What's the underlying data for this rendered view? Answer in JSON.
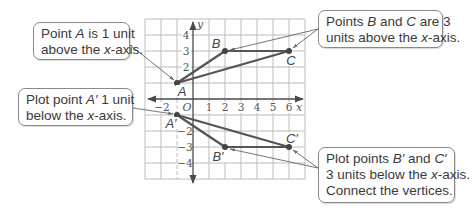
{
  "graph": {
    "x_axis_label": "x",
    "y_axis_label": "y",
    "origin_label": "O",
    "x_ticks": [
      "−2",
      "1",
      "2",
      "3",
      "4",
      "5",
      "6"
    ],
    "y_ticks": [
      "4",
      "3",
      "2",
      "−2",
      "−3",
      "−4"
    ],
    "grid_range": {
      "x": [
        -3,
        7
      ],
      "y": [
        -5,
        5
      ]
    },
    "colors": {
      "grid": "#bdbdbd",
      "axis": "#4a4a4a",
      "polygon": "#555555",
      "arrow": "#666666"
    }
  },
  "points": {
    "A": {
      "label": "A",
      "x": -1,
      "y": 1
    },
    "B": {
      "label": "B",
      "x": 2,
      "y": 3
    },
    "C": {
      "label": "C",
      "x": 6,
      "y": 3
    },
    "A_prime": {
      "label": "A′",
      "x": -1,
      "y": -1
    },
    "B_prime": {
      "label": "B′",
      "x": 2,
      "y": -3
    },
    "C_prime": {
      "label": "C′",
      "x": 6,
      "y": -3
    }
  },
  "callouts": {
    "point_a": {
      "line1_pre": "Point ",
      "line1_var": "A",
      "line1_post": " is 1 unit",
      "line2_pre": "above the ",
      "line2_var": "x",
      "line2_post": "-axis."
    },
    "points_bc": {
      "line1_pre": "Points ",
      "line1_var1": "B",
      "line1_mid": " and ",
      "line1_var2": "C",
      "line1_post": " are 3",
      "line2_pre": "units above the ",
      "line2_var": "x",
      "line2_post": "-axis."
    },
    "plot_a_prime": {
      "line1_pre": "Plot point ",
      "line1_var": "A′",
      "line1_post": " 1 unit",
      "line2_pre": "below the ",
      "line2_var": "x",
      "line2_post": "-axis."
    },
    "plot_bc_prime": {
      "line1_pre": "Plot points ",
      "line1_var1": "B′",
      "line1_mid": " and ",
      "line1_var2": "C′",
      "line2_pre": "3 units below the ",
      "line2_var": "x",
      "line2_post": "-axis.",
      "line3": "Connect the vertices."
    }
  }
}
